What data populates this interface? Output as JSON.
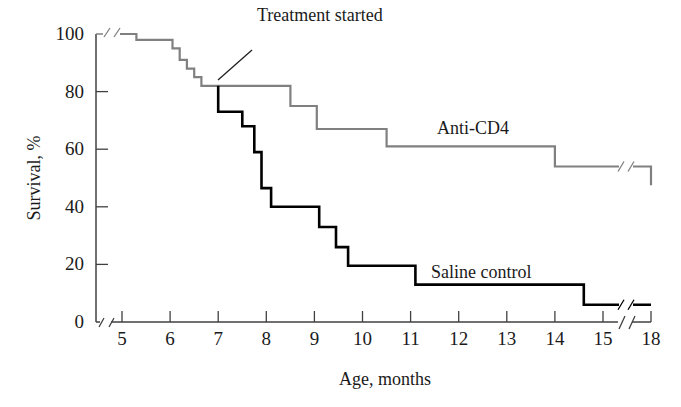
{
  "chart_data": {
    "type": "line",
    "subtype": "step (Kaplan-Meier survival curve)",
    "title": "",
    "xlabel": "Age, months",
    "ylabel": "Survival, %",
    "xlim": [
      5,
      18
    ],
    "ylim": [
      0,
      100
    ],
    "x_ticks": [
      "5",
      "6",
      "7",
      "8",
      "9",
      "10",
      "11",
      "12",
      "13",
      "14",
      "15",
      "18"
    ],
    "y_ticks": [
      "0",
      "20",
      "40",
      "60",
      "80",
      "100"
    ],
    "axis_breaks": {
      "x": "between 15 and 18",
      "y": "near origin and top"
    },
    "grid": false,
    "legend": "inline labels",
    "annotations": [
      {
        "text": "Treatment started",
        "x": 7,
        "y": 82
      }
    ],
    "series": [
      {
        "name": "Anti-CD4",
        "color": "#808080",
        "label_pos": {
          "x": 10.7,
          "y": 64
        },
        "points": [
          [
            4.6,
            100
          ],
          [
            5.3,
            100
          ],
          [
            5.3,
            98
          ],
          [
            6.05,
            98
          ],
          [
            6.05,
            95
          ],
          [
            6.2,
            95
          ],
          [
            6.2,
            91
          ],
          [
            6.35,
            91
          ],
          [
            6.35,
            88
          ],
          [
            6.5,
            88
          ],
          [
            6.5,
            85
          ],
          [
            6.65,
            85
          ],
          [
            6.65,
            82
          ],
          [
            8.5,
            82
          ],
          [
            8.5,
            75
          ],
          [
            9.05,
            75
          ],
          [
            9.05,
            67
          ],
          [
            10.5,
            67
          ],
          [
            10.5,
            61
          ],
          [
            14.0,
            61
          ],
          [
            14.0,
            54
          ],
          [
            18.0,
            54
          ],
          [
            18.0,
            47.5
          ]
        ]
      },
      {
        "name": "Saline control",
        "color": "#000000",
        "label_pos": {
          "x": 11.5,
          "y": 16
        },
        "points": [
          [
            7.0,
            82
          ],
          [
            7.0,
            73
          ],
          [
            7.5,
            73
          ],
          [
            7.5,
            68
          ],
          [
            7.75,
            68
          ],
          [
            7.75,
            59
          ],
          [
            7.9,
            59
          ],
          [
            7.9,
            46.5
          ],
          [
            8.1,
            46.5
          ],
          [
            8.1,
            40
          ],
          [
            9.1,
            40
          ],
          [
            9.1,
            33
          ],
          [
            9.45,
            33
          ],
          [
            9.45,
            26
          ],
          [
            9.7,
            26
          ],
          [
            9.7,
            19.5
          ],
          [
            11.1,
            19.5
          ],
          [
            11.1,
            13
          ],
          [
            14.6,
            13
          ],
          [
            14.6,
            6
          ],
          [
            18.0,
            6
          ]
        ]
      }
    ]
  },
  "colors": {
    "axis": "#404040",
    "anti_cd4": "#808080",
    "saline": "#000000",
    "text": "#1a1a1a"
  }
}
